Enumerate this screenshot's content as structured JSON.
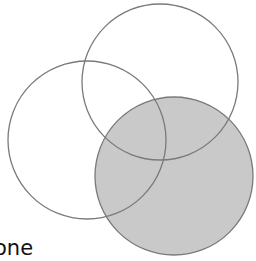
{
  "diagram": {
    "type": "venn",
    "caption": "one",
    "colors": {
      "stroke": "#7a7a7a",
      "shaded_fill": "#c9c9c9",
      "background": "#ffffff"
    },
    "circles": [
      {
        "id": "top",
        "cx": 160,
        "cy": 82,
        "r": 78,
        "shaded": false
      },
      {
        "id": "left",
        "cx": 87,
        "cy": 140,
        "r": 79,
        "shaded": false
      },
      {
        "id": "bottom-right",
        "cx": 174,
        "cy": 176,
        "r": 79,
        "shaded": true
      }
    ]
  }
}
